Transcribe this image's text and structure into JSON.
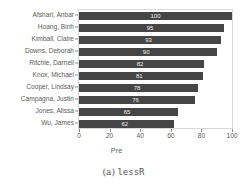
{
  "chart_data": {
    "type": "bar",
    "orientation": "horizontal",
    "title": "",
    "xlabel": "Pre",
    "ylabel": "",
    "xlim": [
      0,
      100
    ],
    "xticks": [
      0,
      20,
      40,
      60,
      80,
      100
    ],
    "grid": false,
    "legend": null,
    "bar_color": "#454545",
    "value_label_color": "#f2f2f2",
    "categories": [
      "Afshari, Anbar",
      "Hoang, Binh",
      "Kimball, Claire",
      "Downs, Deborah",
      "Ritchie, Darnell",
      "Knox, Michael",
      "Cooper, Lindsay",
      "Campagna, Justin",
      "Jones, Alissa",
      "Wu, James"
    ],
    "values": [
      100,
      95,
      93,
      90,
      82,
      81,
      78,
      76,
      65,
      62
    ]
  },
  "caption": {
    "index": "(a)",
    "name": "lessR"
  }
}
